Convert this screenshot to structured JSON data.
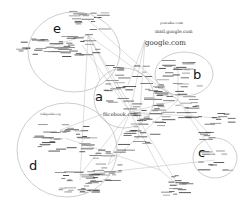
{
  "diagram": {
    "type": "network-graph",
    "colors": {
      "background": "#ffffff",
      "ellipse_stroke": "#b8b8b8",
      "edge": "#c8c8c8",
      "node_text": "#333333",
      "cluster_letter": "#111111"
    },
    "clusters": [
      {
        "id": "a",
        "label": "a",
        "cx": 124,
        "cy": 98,
        "rx": 30,
        "ry": 30
      },
      {
        "id": "b",
        "label": "b",
        "cx": 184,
        "cy": 74,
        "rx": 29,
        "ry": 22
      },
      {
        "id": "c",
        "label": "c",
        "cx": 215,
        "cy": 158,
        "rx": 22,
        "ry": 20
      },
      {
        "id": "d",
        "label": "d",
        "cx": 67,
        "cy": 150,
        "rx": 50,
        "ry": 47
      },
      {
        "id": "e",
        "label": "e",
        "cx": 74,
        "cy": 52,
        "rx": 46,
        "ry": 40
      }
    ],
    "highlighted_labels": [
      {
        "text": "google.com",
        "x": 145,
        "y": 40,
        "size": 7
      },
      {
        "text": "mail.google.com",
        "x": 155,
        "y": 30,
        "size": 4.5
      },
      {
        "text": "youtube.com",
        "x": 160,
        "y": 22,
        "size": 3.5
      },
      {
        "text": "facebook.com",
        "x": 103,
        "y": 112,
        "size": 5
      },
      {
        "text": "wikipedia.org",
        "x": 40,
        "y": 113,
        "size": 3
      }
    ]
  }
}
